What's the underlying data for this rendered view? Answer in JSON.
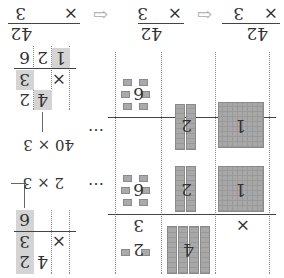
{
  "header_problems": [
    {
      "top": "42",
      "op": "×",
      "bottom": "3"
    },
    {
      "top": "42",
      "op": "×",
      "bottom": "3"
    },
    {
      "top": "42",
      "op": "×",
      "bottom": "3"
    }
  ],
  "arrow_icon": "⇦",
  "blocks": {
    "row1": {
      "hundreds_label": "",
      "tens_label": "4",
      "ones_label": "2",
      "multiplier": "3",
      "op": "×"
    },
    "row2": {
      "hundreds_label": "1",
      "tens_label": "2",
      "ones_label": "6"
    },
    "row3": {
      "hundreds_label": "1",
      "tens_label": "2",
      "ones_label": ""
    }
  },
  "annotations": {
    "step1": "2 × 3",
    "step2": "40 × 3",
    "ellipsis": "⋯"
  },
  "written": {
    "step1": {
      "top": [
        "4",
        "2"
      ],
      "op": "×",
      "bottom": "3",
      "result": [
        "6"
      ]
    },
    "step2": {
      "top": [
        "4",
        "2"
      ],
      "op": "×",
      "bottom": "3",
      "result": [
        "1",
        "2",
        "6"
      ]
    }
  }
}
